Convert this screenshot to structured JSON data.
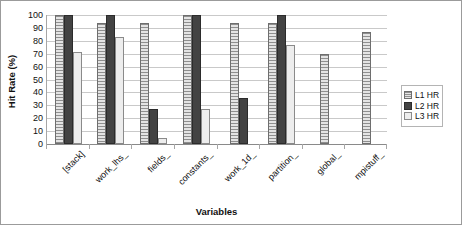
{
  "chart_data": {
    "type": "bar",
    "title": "",
    "xlabel": "Variables",
    "ylabel": "Hit Rate (%)",
    "ylim": [
      0,
      100
    ],
    "yticks": [
      0,
      10,
      20,
      30,
      40,
      50,
      60,
      70,
      80,
      90,
      100
    ],
    "grid": true,
    "legend_position": "right",
    "categories": [
      "[stack]",
      "work_lhs_",
      "fields_",
      "constants_",
      "work_1d_",
      "partition_",
      "global_",
      "mpistuff_"
    ],
    "series": [
      {
        "name": "L1 HR",
        "values": [
          100,
          94,
          94,
          100,
          94,
          94,
          70,
          87
        ]
      },
      {
        "name": "L2 HR",
        "values": [
          100,
          100,
          27,
          100,
          36,
          100,
          0,
          0
        ]
      },
      {
        "name": "L3 HR",
        "values": [
          71,
          83,
          5,
          27,
          0,
          77,
          0,
          0
        ]
      }
    ]
  },
  "legend": {
    "items": [
      {
        "label": "L1 HR",
        "swatch": "light-striped"
      },
      {
        "label": "L2 HR",
        "swatch": "dark-solid"
      },
      {
        "label": "L3 HR",
        "swatch": "very-light"
      }
    ]
  },
  "colors": {
    "series_l1": "#d2d2d2",
    "series_l2": "#434343",
    "series_l3": "#ededed",
    "gridline": "#c9c9c9",
    "axis": "#8a8a8a",
    "text": "#111111",
    "border": "#9b9b9b"
  }
}
